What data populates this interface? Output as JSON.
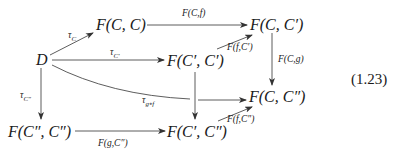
{
  "diagram": {
    "equation_number": "(1.23)",
    "nodes": {
      "D": "D",
      "FCC": "F(C, C)",
      "FCCp": "F(C, C′)",
      "FCpCp": "F(C′, C′)",
      "FCCpp": "F(C, C″)",
      "FCppCpp": "F(C″, C″)",
      "FCpCpp": "F(C′, C″)"
    },
    "edges": {
      "tau_C": "τ",
      "tau_C_sub": "C",
      "tau_Cp": "τ",
      "tau_Cp_sub": "C′",
      "tau_Cpp": "τ",
      "tau_Cpp_sub": "C″",
      "tau_gof": "τ",
      "tau_gof_sub": "g∘f",
      "F_C_f": "F(C,f)",
      "F_f_Cp": "F(f,C′)",
      "F_C_g": "F(C,g)",
      "F_g_Cpp": "F(g,C″)",
      "F_f_Cpp": "F(f,C″)"
    }
  }
}
